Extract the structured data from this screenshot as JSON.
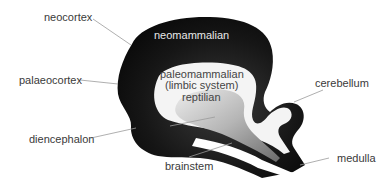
{
  "diagram": {
    "regions": {
      "neomammalian": "neomammalian",
      "paleomammalian_line1": "paleomammalian",
      "paleomammalian_line2": "(limbic system)",
      "reptilian": "reptilian"
    },
    "labels": {
      "neocortex": "neocortex",
      "palaeocortex": "palaeocortex",
      "diencephalon": "diencephalon",
      "brainstem": "brainstem",
      "cerebellum": "cerebellum",
      "medulla": "medulla"
    },
    "colors": {
      "outer": "#111111",
      "limbic": "#f2f2f2",
      "reptilian_light": "#d9d9d9",
      "reptilian_dark": "#777777",
      "leader": "#9a9a9a",
      "text": "#3a3a3a"
    }
  }
}
